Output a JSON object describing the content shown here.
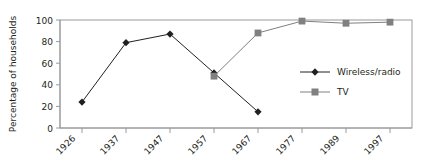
{
  "chart_data": {
    "type": "line",
    "title": "",
    "xlabel": "",
    "ylabel": "Percentage of households",
    "categories": [
      "1926",
      "1937",
      "1947",
      "1957",
      "1967",
      "1977",
      "1989",
      "1997"
    ],
    "ylim": [
      0,
      100
    ],
    "yticks": [
      0,
      20,
      40,
      60,
      80,
      100
    ],
    "ytick_labels": [
      "0",
      "20",
      "40",
      "60",
      "80",
      "100"
    ],
    "grid": false,
    "legend_position": "center-right",
    "series": [
      {
        "name": "Wireless/radio",
        "color": "#231f20",
        "marker": "diamond",
        "values": [
          24,
          79,
          87,
          51,
          15,
          null,
          null,
          null
        ]
      },
      {
        "name": "TV",
        "color": "#808080",
        "marker": "square",
        "values": [
          null,
          null,
          null,
          48,
          88,
          99,
          97,
          98
        ]
      }
    ]
  },
  "legend": {
    "items": [
      {
        "label": "Wireless/radio"
      },
      {
        "label": "TV"
      }
    ]
  },
  "axes": {
    "y_title": "Percentage of households",
    "y_tick_labels": [
      "100",
      "80",
      "60",
      "40",
      "20",
      "0"
    ],
    "x_tick_labels": [
      "1926",
      "1937",
      "1947",
      "1957",
      "1967",
      "1977",
      "1989",
      "1997"
    ]
  },
  "colors": {
    "series_wireless": "#231f20",
    "series_tv": "#808080",
    "frame": "#9a9a9a",
    "text": "#231f20",
    "background": "#ffffff"
  }
}
